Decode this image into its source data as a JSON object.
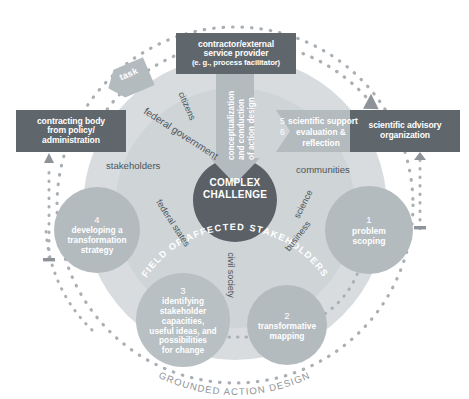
{
  "diagram": {
    "title_curved": "GROUNDED ACTION DESIGN",
    "center": {
      "line1": "COMPLEX",
      "line2": "CHALLENGE"
    },
    "ring_label": "FIELD OF AFFECTED STAKEHOLDERS",
    "flow_arrow_label": "conceptualization and conduction of action design",
    "flow_arrow_lines": {
      "l1": "conceptualization",
      "l2": "and conduction",
      "l3": "of action design"
    },
    "task_arrow_label": "task",
    "support_arrow": {
      "num1": "5",
      "num2": "6",
      "line1": "scientific support",
      "line2": "evaluation &",
      "line3": "reflection"
    }
  },
  "actor_boxes": [
    {
      "name": "contractor-external-service-provider",
      "line1": "contractor/external",
      "line2": "service provider",
      "line3": "(e. g., process facilitator)"
    },
    {
      "name": "contracting-body",
      "line1": "contracting body",
      "line2": "from policy/",
      "line3": "administration"
    },
    {
      "name": "scientific-advisory-organization",
      "line1": "scientific advisory",
      "line2": "organization",
      "line3": ""
    }
  ],
  "phases": [
    {
      "num": "1",
      "line1": "problem",
      "line2": "scoping",
      "line3": "",
      "line4": "",
      "line5": ""
    },
    {
      "num": "2",
      "line1": "transformative",
      "line2": "mapping",
      "line3": "",
      "line4": "",
      "line5": ""
    },
    {
      "num": "3",
      "line1": "identifying",
      "line2": "stakeholder",
      "line3": "capacities,",
      "line4": "useful ideas, and",
      "line5": "possibilities",
      "line6": "for change"
    },
    {
      "num": "4",
      "line1": "developing a",
      "line2": "transformation",
      "line3": "strategy",
      "line4": "",
      "line5": ""
    }
  ],
  "stakeholders": [
    {
      "label": "citizens"
    },
    {
      "label": "federal government"
    },
    {
      "label": "stakeholders"
    },
    {
      "label": "federal states"
    },
    {
      "label": "civil society"
    },
    {
      "label": "business"
    },
    {
      "label": "science"
    },
    {
      "label": "communities"
    }
  ],
  "colors": {
    "box_dark": "#5f666c",
    "center_dark": "#5a6066",
    "phase_circle": "#b4bbbf",
    "field_ring": "#d8dcde",
    "field_inner": "#cfd4d7",
    "arrow_gray": "#b4bbbf",
    "dotted": "#a9afb4",
    "text_dark": "#4e545a",
    "background": "#ffffff"
  }
}
